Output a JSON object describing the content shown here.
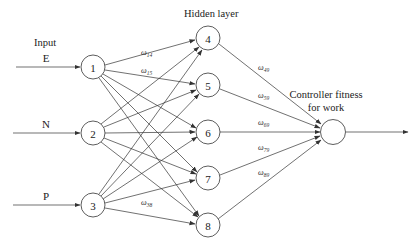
{
  "diagram": {
    "type": "neural-network",
    "labels": {
      "input_layer": "Input",
      "hidden_layer": "Hidden layer",
      "output": "Controller fitness",
      "output_line2": "for work"
    },
    "inputs": [
      {
        "name": "E",
        "node": "1"
      },
      {
        "name": "N",
        "node": "2"
      },
      {
        "name": "P",
        "node": "3"
      }
    ],
    "input_nodes": [
      "1",
      "2",
      "3"
    ],
    "hidden_nodes": [
      "4",
      "5",
      "6",
      "7",
      "8"
    ],
    "output_node": "",
    "weights_input_hidden": [
      {
        "label": "ω",
        "sub": "14"
      },
      {
        "label": "ω",
        "sub": "15"
      },
      {
        "label": "ω",
        "sub": "38"
      }
    ],
    "weights_hidden_output": [
      {
        "label": "ω",
        "sub": "49"
      },
      {
        "label": "ω",
        "sub": "59"
      },
      {
        "label": "ω",
        "sub": "69"
      },
      {
        "label": "ω",
        "sub": "79"
      },
      {
        "label": "ω",
        "sub": "89"
      }
    ]
  }
}
